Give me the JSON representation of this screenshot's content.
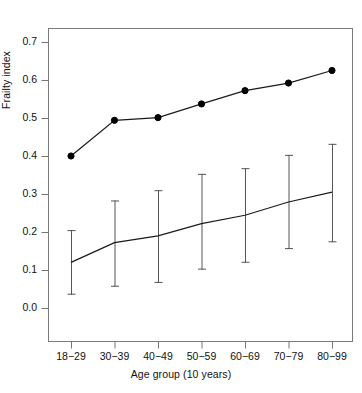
{
  "chart_data": {
    "type": "line",
    "title": "",
    "xlabel": "Age group (10 years)",
    "ylabel": "Frailty index",
    "categories": [
      "18−29",
      "30−39",
      "40−49",
      "50−59",
      "60−69",
      "70−79",
      "80−99"
    ],
    "ylim": [
      -0.045,
      0.775
    ],
    "yticks": [
      0.0,
      0.1,
      0.2,
      0.3,
      0.4,
      0.5,
      0.6,
      0.7
    ],
    "ytick_labels": [
      "0.0",
      "0.1",
      "0.2",
      "0.3",
      "0.4",
      "0.5",
      "0.6",
      "0.7"
    ],
    "grid": false,
    "legend": "none",
    "series": [
      {
        "name": "upper-series-with-points",
        "marker": "filled-circle",
        "values": [
          0.4,
          0.494,
          0.501,
          0.537,
          0.572,
          0.592,
          0.625
        ]
      },
      {
        "name": "lower-series-with-error-bars",
        "marker": "none",
        "values": [
          0.12,
          0.172,
          0.19,
          0.222,
          0.244,
          0.279,
          0.305
        ],
        "error_lower": [
          0.035,
          0.056,
          0.066,
          0.101,
          0.119,
          0.155,
          0.173
        ],
        "error_upper": [
          0.205,
          0.283,
          0.31,
          0.353,
          0.368,
          0.403,
          0.432
        ]
      }
    ],
    "colors": {
      "line": "#1a1a1a",
      "point": "#000000",
      "errorbar": "#555555",
      "axis": "#777777",
      "background": "#ffffff"
    }
  },
  "axes": {
    "x_axis_title": "Age group (10 years)",
    "y_axis_title": "Frailty index"
  }
}
